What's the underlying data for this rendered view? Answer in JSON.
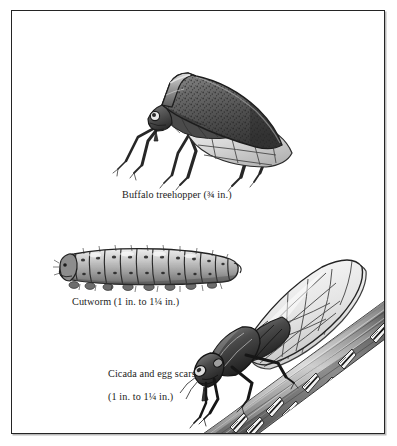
{
  "plate": {
    "title": "Insect identification plate",
    "background_color": "#ffffff",
    "border_color": "#242424",
    "ink_color": "#1b1b1b",
    "medium": "grayscale pen-and-ink / wash illustration"
  },
  "figures": [
    {
      "id": "buffalo-treehopper",
      "common_name": "Buffalo treehopper",
      "size_text": "(¾ in.)",
      "caption": "Buffalo treehopper (¾ in.)",
      "position": "top-center"
    },
    {
      "id": "cutworm",
      "common_name": "Cutworm",
      "size_text": "(1 in. to 1¼ in.)",
      "caption": "Cutworm (1 in. to 1¼ in.)",
      "position": "middle-left"
    },
    {
      "id": "cicada-and-egg-scars",
      "common_name": "Cicada and egg scars",
      "size_text": "(1 in. to 1¼ in.)",
      "caption": "Cicada and egg scars\n(1 in. to 1¼ in.)",
      "caption_line_1": "Cicada and egg scars",
      "caption_line_2": "(1 in. to 1¼ in.)",
      "position": "bottom-right"
    }
  ],
  "captions": {
    "treehopper": "Buffalo treehopper (¾ in.)",
    "cutworm": "Cutworm (1 in. to 1¼ in.)",
    "cicada_line1": "Cicada and egg scars",
    "cicada_line2": "(1 in. to 1¼ in.)"
  },
  "palette": {
    "paper": "#ffffff",
    "frame": "#242424",
    "frame_shadow": "#b9b9b9",
    "text": "#1b1b1b",
    "dark_ink": "#1a1a1a",
    "mid_gray": "#6e6e6e",
    "light_gray": "#c8c8c8",
    "pale_gray": "#e6e6e6",
    "wing_tint": "#dcdcdc",
    "branch_gray": "#8a8a8a"
  }
}
